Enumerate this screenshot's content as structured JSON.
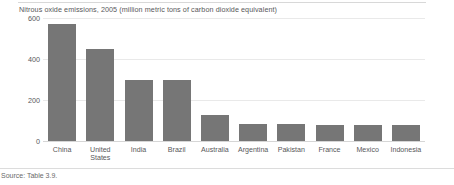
{
  "chart_data": {
    "type": "bar",
    "title": "Nitrous oxide emissions, 2005 (million metric tons of carbon dioxide equivalent)",
    "xlabel": "",
    "ylabel": "",
    "ylim": [
      0,
      600
    ],
    "yticks": [
      0,
      200,
      400,
      600
    ],
    "ytick_labels": [
      "0",
      "200",
      "400",
      "600"
    ],
    "grid": true,
    "legend": false,
    "bar_color": "#767676",
    "categories": [
      "China",
      "United States",
      "India",
      "Brazil",
      "Australia",
      "Argentina",
      "Pakistan",
      "France",
      "Mexico",
      "Indonesia"
    ],
    "category_lines": [
      [
        "China"
      ],
      [
        "United",
        "States"
      ],
      [
        "India"
      ],
      [
        "Brazil"
      ],
      [
        "Australia"
      ],
      [
        "Argentina"
      ],
      [
        "Pakistan"
      ],
      [
        "France"
      ],
      [
        "Mexico"
      ],
      [
        "Indonesia"
      ]
    ],
    "values": [
      570,
      450,
      300,
      300,
      125,
      85,
      85,
      80,
      80,
      80
    ]
  },
  "footer": {
    "source": "Source: Table 3.9."
  }
}
